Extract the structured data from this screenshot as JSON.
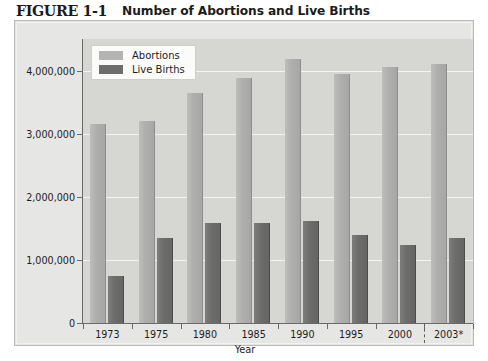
{
  "figure": {
    "number": "FIGURE 1-1",
    "title": "Number of Abortions and Live Births"
  },
  "chart_data": {
    "type": "bar",
    "title": "Number of Abortions and Live Births",
    "xlabel": "Year",
    "ylabel": "",
    "categories": [
      "1973",
      "1975",
      "1980",
      "1985",
      "1990",
      "1995",
      "2000",
      "2003*"
    ],
    "series": [
      {
        "name": "Abortions",
        "color": "#b0b0ae",
        "values": [
          3150000,
          3200000,
          3650000,
          3880000,
          4180000,
          3950000,
          4060000,
          4100000
        ]
      },
      {
        "name": "Live Births",
        "color": "#6d6d6b",
        "values": [
          750000,
          1350000,
          1580000,
          1590000,
          1620000,
          1400000,
          1240000,
          1350000
        ]
      }
    ],
    "ylim": [
      0,
      4500000
    ],
    "yticks": [
      0,
      1000000,
      2000000,
      3000000,
      4000000
    ],
    "ytick_labels": [
      "0",
      "1,000,000",
      "2,000,000",
      "3,000,000",
      "4,000,000"
    ],
    "grid": true,
    "legend_position": "top-left",
    "annotations": [
      {
        "name": "projection-divider",
        "after_category": "2000",
        "style": "dashed"
      }
    ]
  }
}
